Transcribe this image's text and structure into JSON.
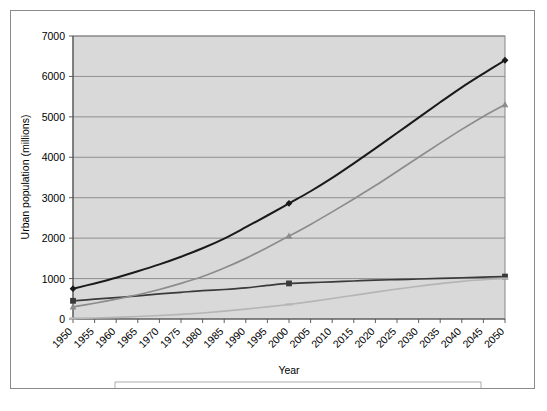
{
  "chart_data": {
    "type": "line",
    "title": "",
    "xlabel": "Year",
    "ylabel": "Urban population (millions)",
    "xlim": [
      1950,
      2050
    ],
    "ylim": [
      0,
      7000
    ],
    "ytick_step": 1000,
    "xtick_step": 5,
    "grid": true,
    "legend_position": "bottom",
    "plot_background": "#d9d9d9",
    "x": [
      1950,
      1955,
      1960,
      1965,
      1970,
      1975,
      1980,
      1985,
      1990,
      1995,
      2000,
      2005,
      2010,
      2015,
      2020,
      2025,
      2030,
      2035,
      2040,
      2045,
      2050
    ],
    "xticklabels": [
      "1950",
      "1955",
      "1960",
      "1965",
      "1970",
      "1975",
      "1980",
      "1985",
      "1990",
      "1995",
      "2000",
      "2005",
      "2010",
      "2015",
      "2020",
      "2025",
      "2030",
      "2035",
      "2040",
      "2045",
      "2050"
    ],
    "yticklabels": [
      "0",
      "1000",
      "2000",
      "3000",
      "4000",
      "5000",
      "6000",
      "7000"
    ],
    "series": [
      {
        "name": "World",
        "color": "#1a1a1a",
        "marker": "diamond",
        "width": 2.0,
        "values": [
          750,
          880,
          1020,
          1180,
          1350,
          1540,
          1750,
          1990,
          2270,
          2560,
          2860,
          3160,
          3490,
          3850,
          4220,
          4600,
          4980,
          5360,
          5730,
          6070,
          6400
        ]
      },
      {
        "name": "Developed",
        "color": "#3a3a3a",
        "marker": "square",
        "width": 1.7,
        "values": [
          450,
          490,
          530,
          570,
          620,
          660,
          700,
          730,
          770,
          830,
          880,
          900,
          920,
          940,
          960,
          975,
          990,
          1005,
          1020,
          1035,
          1050
        ]
      },
      {
        "name": "Developing",
        "color": "#8c8c8c",
        "marker": "triangle",
        "width": 1.7,
        "values": [
          300,
          390,
          490,
          600,
          730,
          880,
          1050,
          1260,
          1500,
          1770,
          2050,
          2340,
          2650,
          2970,
          3300,
          3650,
          4000,
          4350,
          4690,
          5010,
          5300
        ]
      },
      {
        "name": "Least developed",
        "color": "#b5b5b5",
        "marker": "dash",
        "width": 1.6,
        "values": [
          15,
          25,
          40,
          60,
          85,
          115,
          150,
          195,
          245,
          300,
          360,
          430,
          505,
          585,
          665,
          740,
          810,
          875,
          930,
          970,
          1000
        ]
      }
    ],
    "legend_entries": [
      {
        "label": "World",
        "color": "#1a1a1a",
        "marker": "diamond"
      },
      {
        "label": "Developed",
        "color": "#3a3a3a",
        "marker": "square"
      },
      {
        "label": "Developing",
        "color": "#8c8c8c",
        "marker": "triangle"
      },
      {
        "label": "Least developed",
        "color": "#b5b5b5",
        "marker": "dash"
      }
    ],
    "marker_years": [
      1950,
      2000,
      2050
    ]
  }
}
